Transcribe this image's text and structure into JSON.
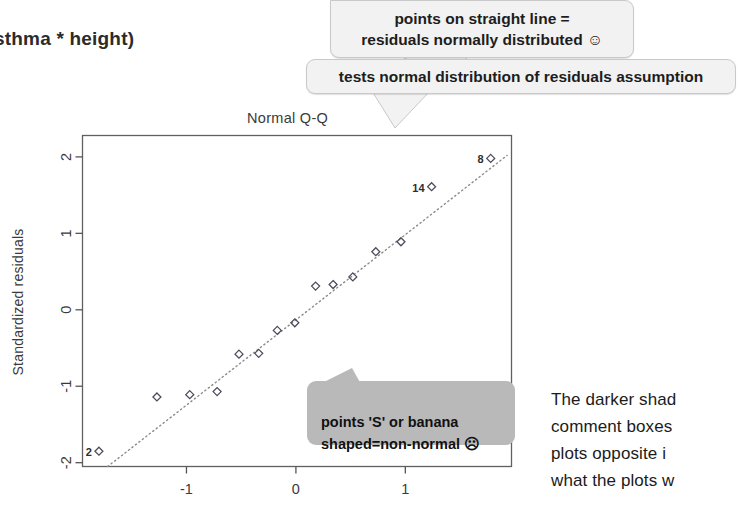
{
  "formula_fragment": "sthma * height)",
  "callouts": [
    {
      "id": "points-straight-line",
      "text": "points on straight line =\nresiduals normally distributed ☺"
    },
    {
      "id": "tests-normality",
      "text": "tests normal distribution of residuals assumption"
    },
    {
      "id": "s-or-banana",
      "text": "points 'S' or banana\nshaped=non-normal ☹"
    }
  ],
  "body_copy": "The darker shad\ncomment boxes\nplots opposite i\nwhat the plots w",
  "colors": {
    "callout_fill": "#f2f2f2",
    "callout_border": "#c9c9c9",
    "plot_comment_fill": "#b9b9b9",
    "axis": "#555555",
    "point_stroke": "#4a4a5a",
    "reference_line": "#8a8a8a"
  },
  "chart_data": {
    "type": "scatter",
    "title": "Normal Q-Q",
    "xlabel": "",
    "ylabel": "Standardized residuals",
    "xlim": [
      -1.95,
      1.97
    ],
    "ylim": [
      -2.05,
      2.28
    ],
    "xticks": [
      -1,
      0,
      1
    ],
    "xticklabels": [
      "-1",
      "0",
      "1"
    ],
    "yticks": [
      -2,
      -1,
      0,
      1,
      2
    ],
    "yticklabels": [
      "-2",
      "-1",
      "0",
      "1",
      "2"
    ],
    "grid": false,
    "legend": null,
    "reference_line": {
      "style": "dotted",
      "x": [
        -1.72,
        1.93
      ],
      "y": [
        -2.05,
        2.02
      ]
    },
    "points": [
      {
        "x": -1.8,
        "y": -1.85,
        "label": "2"
      },
      {
        "x": -1.27,
        "y": -1.14,
        "label": null
      },
      {
        "x": -0.97,
        "y": -1.11,
        "label": null
      },
      {
        "x": -0.72,
        "y": -1.07,
        "label": null
      },
      {
        "x": -0.52,
        "y": -0.58,
        "label": null
      },
      {
        "x": -0.34,
        "y": -0.57,
        "label": null
      },
      {
        "x": -0.17,
        "y": -0.27,
        "label": null
      },
      {
        "x": -0.01,
        "y": -0.17,
        "label": null
      },
      {
        "x": 0.18,
        "y": 0.31,
        "label": null
      },
      {
        "x": 0.34,
        "y": 0.33,
        "label": null
      },
      {
        "x": 0.52,
        "y": 0.43,
        "label": null
      },
      {
        "x": 0.73,
        "y": 0.76,
        "label": null
      },
      {
        "x": 0.96,
        "y": 0.89,
        "label": null
      },
      {
        "x": 1.24,
        "y": 1.61,
        "label": "14"
      },
      {
        "x": 1.78,
        "y": 1.98,
        "label": "8"
      }
    ]
  }
}
